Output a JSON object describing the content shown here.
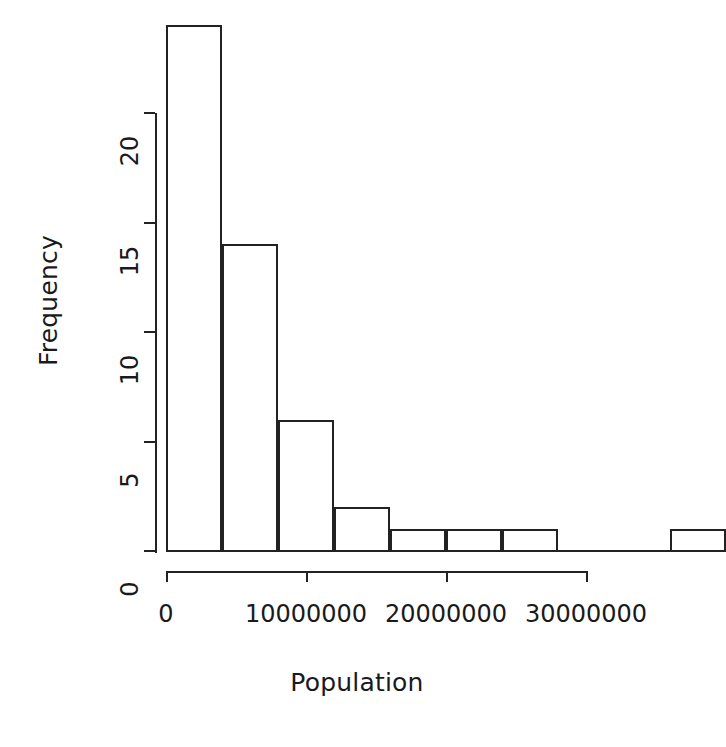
{
  "chart_data": {
    "type": "bar",
    "title": "",
    "subtitle": "",
    "xlabel": "Population",
    "ylabel": "Frequency",
    "grid": false,
    "legend": null,
    "xlim": [
      0,
      38000000
    ],
    "ylim": [
      0,
      24
    ],
    "bin_width": 4000000,
    "x_ticks": [
      0,
      10000000,
      20000000,
      30000000
    ],
    "x_tick_labels": [
      "0",
      "10000000",
      "20000000",
      "30000000"
    ],
    "y_ticks": [
      0,
      5,
      10,
      15,
      20
    ],
    "y_tick_labels": [
      "0",
      "5",
      "10",
      "15",
      "20"
    ],
    "bins": [
      {
        "x0": 0,
        "x1": 4000000,
        "count": 24
      },
      {
        "x0": 4000000,
        "x1": 8000000,
        "count": 14
      },
      {
        "x0": 8000000,
        "x1": 12000000,
        "count": 6
      },
      {
        "x0": 12000000,
        "x1": 16000000,
        "count": 2
      },
      {
        "x0": 16000000,
        "x1": 20000000,
        "count": 1
      },
      {
        "x0": 20000000,
        "x1": 24000000,
        "count": 1
      },
      {
        "x0": 24000000,
        "x1": 28000000,
        "count": 1
      },
      {
        "x0": 28000000,
        "x1": 32000000,
        "count": 0
      },
      {
        "x0": 32000000,
        "x1": 36000000,
        "count": 0
      },
      {
        "x0": 36000000,
        "x1": 40000000,
        "count": 1
      }
    ],
    "categories": [
      "0-4M",
      "4M-8M",
      "8M-12M",
      "12M-16M",
      "16M-20M",
      "20M-24M",
      "24M-28M",
      "28M-32M",
      "32M-36M",
      "36M-40M"
    ],
    "values": [
      24,
      14,
      6,
      2,
      1,
      1,
      1,
      0,
      0,
      1
    ],
    "colors": {
      "bar_stroke": "#222222",
      "bar_fill": "transparent",
      "axis": "#222222",
      "text": "#1a1a1a",
      "background": "#ffffff"
    }
  }
}
